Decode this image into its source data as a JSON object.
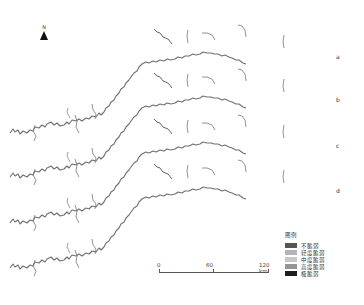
{
  "north_arrow": {
    "label": "N"
  },
  "panels": [
    {
      "label": "a",
      "offset_y": 0
    },
    {
      "label": "b",
      "offset_y": 44
    },
    {
      "label": "c",
      "offset_y": 90
    },
    {
      "label": "d",
      "offset_y": 135
    }
  ],
  "legend": {
    "title": "图例",
    "items": [
      {
        "label": "不脆弱",
        "color": "#555555"
      },
      {
        "label": "轻度脆弱",
        "color": "#b4b4b4"
      },
      {
        "label": "中度脆弱",
        "color": "#c8c8c8"
      },
      {
        "label": "高度脆弱",
        "color": "#969696"
      },
      {
        "label": "极脆弱",
        "color": "#1e1e1e"
      }
    ]
  },
  "scale_bar": {
    "ticks": [
      "0",
      "60",
      "120 km"
    ]
  },
  "colors": {
    "river": "#6e6e6e",
    "river_dark": "#3a3a3a"
  }
}
